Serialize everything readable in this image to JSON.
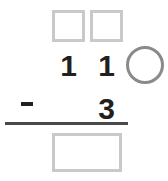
{
  "problem": {
    "type": "vertical-subtraction-with-regrouping",
    "operator": "−",
    "minuend": {
      "regroup_boxes": [
        {
          "name": "tens",
          "value": ""
        },
        {
          "name": "ones",
          "value": ""
        }
      ],
      "digits": [
        {
          "place": "tens",
          "value": "1"
        },
        {
          "place": "ones",
          "value": "1"
        }
      ],
      "regroup_circle": {
        "value": ""
      }
    },
    "subtrahend": {
      "digits": [
        {
          "place": "ones",
          "value": "3"
        }
      ]
    },
    "answer": {
      "value": ""
    }
  },
  "colors": {
    "box_border": "#c9c9c9",
    "circle_border": "#8a8a8a",
    "digit": "#231f20",
    "rule": "#4a4a4a",
    "background": "#ffffff"
  }
}
